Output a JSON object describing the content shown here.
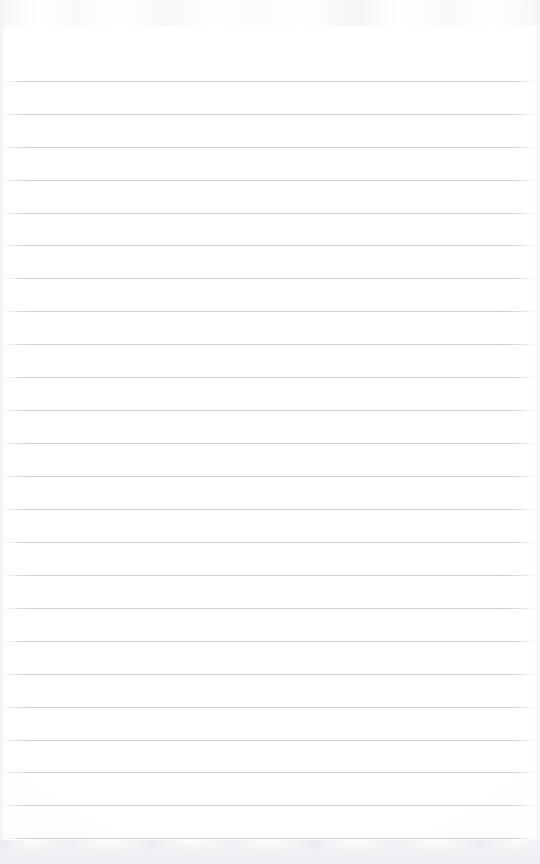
{
  "document": {
    "kind": "ruled-notepad-page",
    "title": "Blank Lined Notepad Page",
    "page_width": 540,
    "page_height": 864,
    "background_color": "#ffffff",
    "has_text_content": false,
    "body_text": ""
  },
  "header_margin": {
    "height": 81,
    "content": ""
  },
  "ruling": {
    "style": "horizontal-ruled",
    "line_color": "#c9ccd4",
    "line_thickness": 1,
    "line_spacing": 32.9,
    "first_line_y": 81,
    "last_line_y": 838,
    "line_count": 24,
    "left_margin": 3,
    "right_margin": 6,
    "has_vertical_margin_rule": false,
    "lines": [
      {
        "index": 1,
        "y": 81,
        "text": ""
      },
      {
        "index": 2,
        "y": 114,
        "text": ""
      },
      {
        "index": 3,
        "y": 147,
        "text": ""
      },
      {
        "index": 4,
        "y": 180,
        "text": ""
      },
      {
        "index": 5,
        "y": 213,
        "text": ""
      },
      {
        "index": 6,
        "y": 245,
        "text": ""
      },
      {
        "index": 7,
        "y": 278,
        "text": ""
      },
      {
        "index": 8,
        "y": 311,
        "text": ""
      },
      {
        "index": 9,
        "y": 344,
        "text": ""
      },
      {
        "index": 10,
        "y": 377,
        "text": ""
      },
      {
        "index": 11,
        "y": 410,
        "text": ""
      },
      {
        "index": 12,
        "y": 443,
        "text": ""
      },
      {
        "index": 13,
        "y": 476,
        "text": ""
      },
      {
        "index": 14,
        "y": 509,
        "text": ""
      },
      {
        "index": 15,
        "y": 542,
        "text": ""
      },
      {
        "index": 16,
        "y": 575,
        "text": ""
      },
      {
        "index": 17,
        "y": 608,
        "text": ""
      },
      {
        "index": 18,
        "y": 641,
        "text": ""
      },
      {
        "index": 19,
        "y": 674,
        "text": ""
      },
      {
        "index": 20,
        "y": 707,
        "text": ""
      },
      {
        "index": 21,
        "y": 740,
        "text": ""
      },
      {
        "index": 22,
        "y": 772,
        "text": ""
      },
      {
        "index": 23,
        "y": 805,
        "text": ""
      },
      {
        "index": 24,
        "y": 838,
        "text": ""
      }
    ]
  },
  "scan_artifacts": {
    "top_mottling": true,
    "bottom_shadow_band": true,
    "bottom_band_color": "#eeeef3",
    "left_edge_shading": true,
    "right_edge_shading": true
  }
}
